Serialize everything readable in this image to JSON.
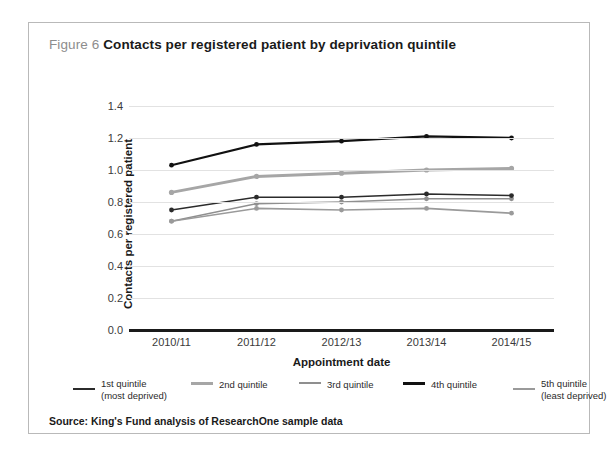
{
  "figure": {
    "number_label": "Figure 6",
    "title": "Contacts per registered patient by deprivation quintile",
    "source": "Source: King's Fund analysis of ResearchOne sample data"
  },
  "chart_data": {
    "type": "line",
    "title": "Contacts per registered patient by deprivation quintile",
    "xlabel": "Appointment date",
    "ylabel": "Contacts per registered patient",
    "categories": [
      "2010/11",
      "2011/12",
      "2012/13",
      "2013/14",
      "2014/15"
    ],
    "ylim": [
      0.0,
      1.4
    ],
    "ytick_labels": [
      "0.0",
      "0.2",
      "0.4",
      "0.6",
      "0.8",
      "1.0",
      "1.2",
      "1.4"
    ],
    "ytick_values": [
      0.0,
      0.2,
      0.4,
      0.6,
      0.8,
      1.0,
      1.2,
      1.4
    ],
    "grid": true,
    "legend_position": "below",
    "series": [
      {
        "name": "1st quintile",
        "sub_name": "(most deprived)",
        "color": "#2b2b2b",
        "width": 1.6,
        "values": [
          0.75,
          0.83,
          0.83,
          0.85,
          0.84
        ]
      },
      {
        "name": "2nd quintile",
        "sub_name": "",
        "color": "#a6a6a6",
        "width": 3.0,
        "values": [
          0.86,
          0.96,
          0.98,
          1.0,
          1.01
        ]
      },
      {
        "name": "3rd quintile",
        "sub_name": "",
        "color": "#8f8f8f",
        "width": 1.6,
        "values": [
          0.68,
          0.79,
          0.8,
          0.82,
          0.82
        ]
      },
      {
        "name": "4th quintile",
        "sub_name": "",
        "color": "#111111",
        "width": 2.2,
        "values": [
          1.03,
          1.16,
          1.18,
          1.21,
          1.2
        ]
      },
      {
        "name": "5th quintile",
        "sub_name": "(least deprived)",
        "color": "#9a9a9a",
        "width": 1.6,
        "values": [
          0.68,
          0.76,
          0.75,
          0.76,
          0.73
        ]
      }
    ]
  },
  "legend": [
    {
      "label": "1st quintile",
      "sub": "(most deprived)",
      "color": "#2b2b2b",
      "thickness": 2
    },
    {
      "label": "2nd quintile",
      "sub": "",
      "color": "#a6a6a6",
      "thickness": 3
    },
    {
      "label": "3rd quintile",
      "sub": "",
      "color": "#8f8f8f",
      "thickness": 2
    },
    {
      "label": "4th quintile",
      "sub": "",
      "color": "#111111",
      "thickness": 3
    },
    {
      "label": "5th quintile",
      "sub": "(least deprived)",
      "color": "#9a9a9a",
      "thickness": 2
    }
  ]
}
